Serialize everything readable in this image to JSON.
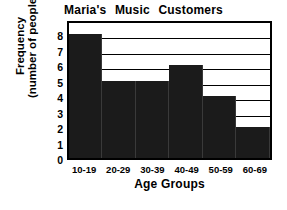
{
  "chart_data": {
    "type": "bar",
    "title": "Maria's Music Customers",
    "xlabel": "Age Groups",
    "ylabel_line1": "Frequency",
    "ylabel_line2": "(number of people)",
    "categories": [
      "10-19",
      "20-29",
      "30-39",
      "40-49",
      "50-59",
      "60-69"
    ],
    "values": [
      8,
      5,
      5,
      6,
      4,
      2
    ],
    "yticks": [
      0,
      1,
      2,
      3,
      4,
      5,
      6,
      7,
      8
    ],
    "ytick_labels": [
      "0",
      "1",
      "2",
      "3",
      "4",
      "5",
      "6",
      "7",
      "8"
    ],
    "ylim": [
      0,
      9
    ],
    "grid": true,
    "grid_axis": "y",
    "legend": "none",
    "bar_color": "#1b1b1b",
    "axis_color": "#000000",
    "background_color": "#ffffff"
  }
}
